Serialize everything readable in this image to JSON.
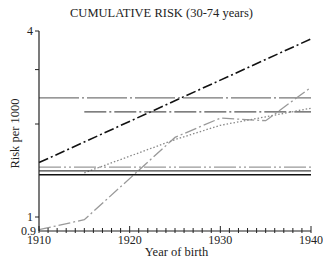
{
  "chart_data": {
    "type": "line",
    "title": "CUMULATIVE RISK (30-74 years)",
    "xlabel": "Year of birth",
    "ylabel": "Risk per 1000",
    "yscale": "log",
    "xlim": [
      1910,
      1940
    ],
    "ylim": [
      0.9,
      4
    ],
    "x_ticks": [
      1910,
      1920,
      1930,
      1940
    ],
    "y_tick_labels": [
      "0.9",
      "1",
      "4"
    ],
    "y_minor_ticks": [
      2,
      3
    ],
    "grid": false,
    "legend": null,
    "series": [
      {
        "name": "black dash-dot (rising)",
        "color": "#111111",
        "dash": "10,3,2,3",
        "width": 1.6,
        "x": [
          1910,
          1940
        ],
        "y": [
          1.5,
          3.77
        ]
      },
      {
        "name": "gray long-dash-dot (flat, upper)",
        "color": "#777777",
        "dash": "40,3,2,3",
        "width": 1.3,
        "x": [
          1910,
          1940
        ],
        "y": [
          2.43,
          2.43
        ]
      },
      {
        "name": "dark-gray dash-dot (flat)",
        "color": "#555555",
        "dash": "22,3,2,3",
        "width": 1.3,
        "x": [
          1915,
          1940
        ],
        "y": [
          2.19,
          2.19
        ]
      },
      {
        "name": "gray dash-dot (rising, irregular)",
        "color": "#999999",
        "dash": "12,3,2,3",
        "width": 1.3,
        "x": [
          1910,
          1915,
          1925,
          1930,
          1935,
          1940
        ],
        "y": [
          0.91,
          0.98,
          1.81,
          2.09,
          2.05,
          2.63
        ]
      },
      {
        "name": "dotted (rising)",
        "color": "#888888",
        "dash": "1.5,2",
        "width": 1.3,
        "x": [
          1915,
          1925,
          1930,
          1935,
          1940
        ],
        "y": [
          1.39,
          1.78,
          1.98,
          2.11,
          2.25
        ]
      },
      {
        "name": "gray dash-dot-dot (flat)",
        "color": "#999999",
        "dash": "22,3,2,3,2,3",
        "width": 1.3,
        "x": [
          1910,
          1940
        ],
        "y": [
          1.45,
          1.45
        ]
      },
      {
        "name": "dark-gray solid (flat)",
        "color": "#444444",
        "dash": "",
        "width": 1.3,
        "x": [
          1910,
          1940
        ],
        "y": [
          1.41,
          1.41
        ]
      },
      {
        "name": "black solid (flat)",
        "color": "#111111",
        "dash": "",
        "width": 1.5,
        "x": [
          1910,
          1940
        ],
        "y": [
          1.37,
          1.37
        ]
      }
    ]
  }
}
